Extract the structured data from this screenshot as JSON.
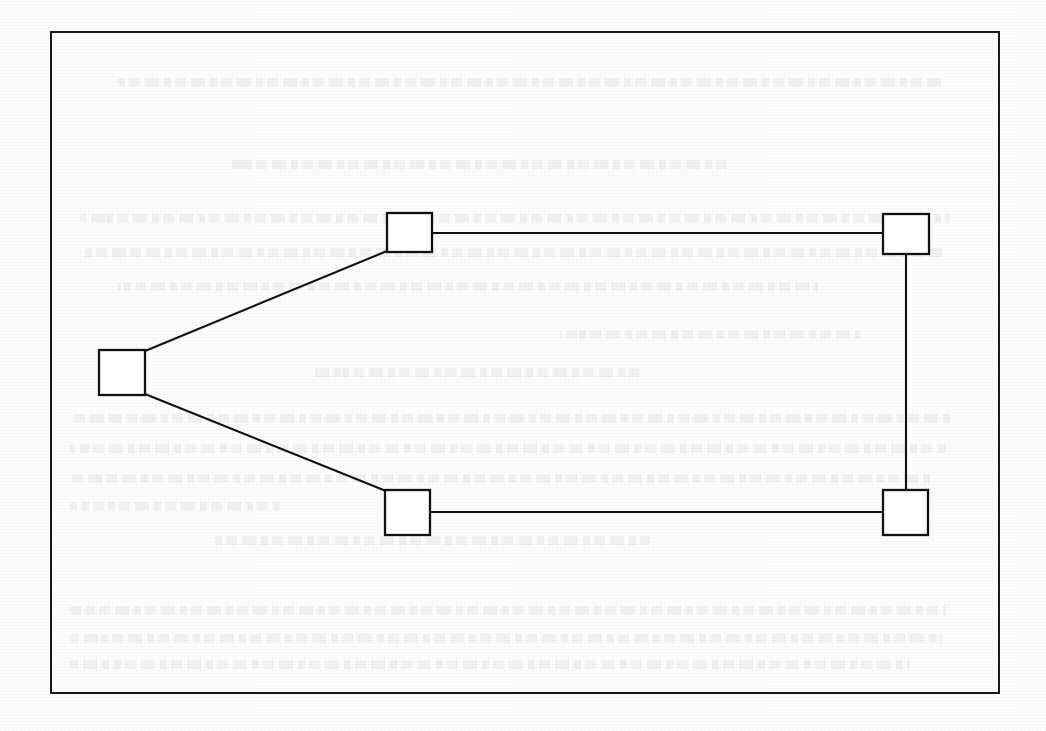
{
  "page": {
    "kind": "scanned-book-page",
    "background_color": "#fdfdfd",
    "ink_color": "#111111",
    "width": 1046,
    "height": 731
  },
  "figure_frame": {
    "name": "figure-border",
    "x": 50,
    "y": 31,
    "width": 950,
    "height": 663,
    "stroke_color": "#1a1a1a",
    "stroke_width": 2
  },
  "ghost_text": {
    "description": "illegible bleed-through from the reverse side of the sheet",
    "legible": false,
    "opacity": 0.09,
    "lines": [
      {
        "x": 118,
        "y": 78,
        "width": 828
      },
      {
        "x": 232,
        "y": 160,
        "width": 500
      },
      {
        "x": 80,
        "y": 214,
        "width": 870
      },
      {
        "x": 80,
        "y": 248,
        "width": 862
      },
      {
        "x": 118,
        "y": 282,
        "width": 700
      },
      {
        "x": 560,
        "y": 330,
        "width": 300
      },
      {
        "x": 310,
        "y": 368,
        "width": 330
      },
      {
        "x": 70,
        "y": 414,
        "width": 880
      },
      {
        "x": 70,
        "y": 444,
        "width": 876
      },
      {
        "x": 70,
        "y": 474,
        "width": 862
      },
      {
        "x": 70,
        "y": 502,
        "width": 210
      },
      {
        "x": 210,
        "y": 536,
        "width": 440
      },
      {
        "x": 70,
        "y": 606,
        "width": 876
      },
      {
        "x": 70,
        "y": 634,
        "width": 872
      },
      {
        "x": 70,
        "y": 660,
        "width": 840
      }
    ]
  },
  "chart_data": {
    "type": "diagram",
    "subtype": "node-link-graph",
    "title": "",
    "xlabel": "",
    "ylabel": "",
    "grid": false,
    "legend": null,
    "coordinate_space": {
      "width": 1046,
      "height": 731
    },
    "node_style": {
      "shape": "square",
      "fill": "#ffffff",
      "stroke": "#111111",
      "stroke_width": 2.3
    },
    "edge_style": {
      "stroke": "#111111",
      "stroke_width": 2.1,
      "arrowheads": false,
      "directed": false
    },
    "nodes": [
      {
        "id": "n-left",
        "label": "",
        "x": 99,
        "y": 350,
        "width": 46,
        "height": 45
      },
      {
        "id": "n-top-left",
        "label": "",
        "x": 387,
        "y": 213,
        "width": 45,
        "height": 39
      },
      {
        "id": "n-top-right",
        "label": "",
        "x": 883,
        "y": 214,
        "width": 46,
        "height": 40
      },
      {
        "id": "n-bottom-left",
        "label": "",
        "x": 385,
        "y": 490,
        "width": 45,
        "height": 45
      },
      {
        "id": "n-bottom-right",
        "label": "",
        "x": 883,
        "y": 490,
        "width": 45,
        "height": 45
      }
    ],
    "edges": [
      {
        "id": "e-left-topleft",
        "from": "n-left",
        "to": "n-top-left",
        "kind": "diagonal",
        "x1": 145,
        "y1": 351,
        "x2": 387,
        "y2": 251
      },
      {
        "id": "e-left-bottomleft",
        "from": "n-left",
        "to": "n-bottom-left",
        "kind": "diagonal",
        "x1": 145,
        "y1": 394,
        "x2": 386,
        "y2": 491
      },
      {
        "id": "e-topleft-topright",
        "from": "n-top-left",
        "to": "n-top-right",
        "kind": "horizontal",
        "x1": 432,
        "y1": 233,
        "x2": 883,
        "y2": 233
      },
      {
        "id": "e-topright-botright",
        "from": "n-top-right",
        "to": "n-bottom-right",
        "kind": "vertical",
        "x1": 906,
        "y1": 254,
        "x2": 906,
        "y2": 490
      },
      {
        "id": "e-botleft-botright",
        "from": "n-bottom-left",
        "to": "n-bottom-right",
        "kind": "horizontal",
        "x1": 430,
        "y1": 512,
        "x2": 883,
        "y2": 512
      }
    ],
    "node_count": 5,
    "edge_count": 5
  }
}
